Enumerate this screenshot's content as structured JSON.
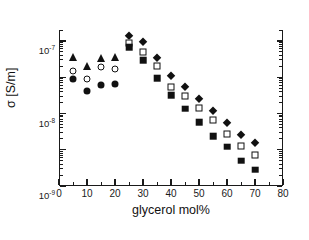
{
  "chart_data": {
    "type": "scatter",
    "title": "",
    "xlabel": "glycerol mol%",
    "ylabel": "σ [S/m]",
    "xlim": [
      0,
      80
    ],
    "ylim": [
      1e-11,
      2e-07
    ],
    "yscale": "log",
    "xscale": "linear",
    "grid": false,
    "legend": "none",
    "xticks": [
      0,
      10,
      20,
      30,
      40,
      50,
      60,
      70,
      80
    ],
    "xticklabels": [
      "0",
      "10",
      "20",
      "30",
      "40",
      "50",
      "60",
      "70",
      "80"
    ],
    "yticks": [
      1e-11,
      1e-10,
      1e-09,
      1e-08,
      1e-07
    ],
    "yticklabels": [
      "10-11",
      "10-10",
      "10-9",
      "10-8",
      "10-7"
    ],
    "series": [
      {
        "name": "filled-triangle",
        "marker": "triangle-filled",
        "x": [
          5,
          10,
          15,
          20
        ],
        "y": [
          3.5e-08,
          2.1e-08,
          3.3e-08,
          3.6e-08
        ]
      },
      {
        "name": "open-circle",
        "marker": "circle-open",
        "x": [
          5,
          10,
          15,
          20
        ],
        "y": [
          1.5e-08,
          9e-09,
          1.9e-08,
          1.7e-08
        ]
      },
      {
        "name": "filled-circle",
        "marker": "circle-filled",
        "x": [
          5,
          10,
          15,
          20
        ],
        "y": [
          9e-09,
          4.2e-09,
          6e-09,
          6.3e-09
        ]
      },
      {
        "name": "filled-diamond",
        "marker": "diamond-filled",
        "x": [
          25,
          30,
          35,
          40,
          45,
          50,
          55,
          60,
          65,
          70
        ],
        "y": [
          1.35e-07,
          9.3e-08,
          3.4e-08,
          1.1e-08,
          5.2e-09,
          2.5e-09,
          1.15e-09,
          5.6e-10,
          2.5e-10,
          1.55e-10
        ]
      },
      {
        "name": "open-square",
        "marker": "square-open",
        "x": [
          25,
          30,
          35,
          40,
          45,
          50,
          55,
          60,
          65,
          70
        ],
        "y": [
          9e-08,
          5e-08,
          2e-08,
          5.5e-09,
          3.1e-09,
          1.45e-09,
          6.6e-10,
          2.7e-10,
          1.25e-10,
          7e-11
        ]
      },
      {
        "name": "filled-square",
        "marker": "square-filled",
        "x": [
          25,
          30,
          35,
          40,
          45,
          50,
          55,
          60,
          65,
          70
        ],
        "y": [
          6.8e-08,
          2.9e-08,
          9.5e-09,
          3.2e-09,
          1.35e-09,
          5.7e-10,
          2.4e-10,
          1.2e-10,
          5e-11,
          2.8e-11
        ]
      }
    ]
  }
}
